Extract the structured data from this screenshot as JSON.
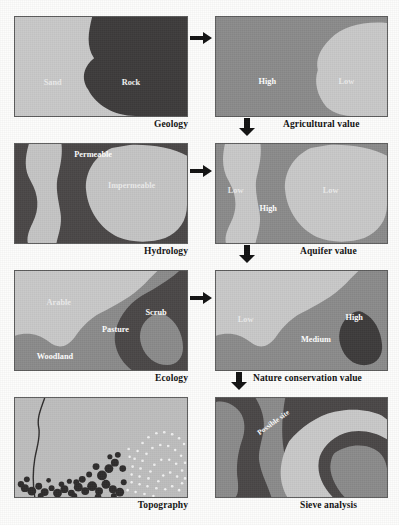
{
  "figure": {
    "colors": {
      "light_gray": "#c9c9c9",
      "mid_gray": "#8f8f8f",
      "dark_gray": "#4a4a4a",
      "very_dark": "#3b3b3b",
      "border": "#5d5d5d",
      "label_text": "#ffffff",
      "caption_text": "#111111",
      "page_background": "#fdfdfc"
    }
  },
  "panels": [
    {
      "id": "geology",
      "caption": "Geology",
      "caption_align": "right",
      "regions": [
        {
          "name": "sand",
          "label": "Sand",
          "tone": "light"
        },
        {
          "name": "rock",
          "label": "Rock",
          "tone": "very-dark"
        }
      ]
    },
    {
      "id": "agricultural-value",
      "caption": "Agricultural value",
      "caption_align": "left",
      "regions": [
        {
          "name": "high",
          "label": "High",
          "tone": "mid"
        },
        {
          "name": "low",
          "label": "Low",
          "tone": "light"
        }
      ]
    },
    {
      "id": "hydrology",
      "caption": "Hydrology",
      "caption_align": "right",
      "regions": [
        {
          "name": "permeable",
          "label": "Permeable",
          "tone": "dark"
        },
        {
          "name": "impermeable",
          "label": "Impermeable",
          "tone": "light"
        }
      ]
    },
    {
      "id": "aquifer-value",
      "caption": "Aquifer value",
      "caption_align": "left",
      "regions": [
        {
          "name": "low-west",
          "label": "Low",
          "tone": "light"
        },
        {
          "name": "high",
          "label": "High",
          "tone": "mid"
        },
        {
          "name": "low-east",
          "label": "Low",
          "tone": "light"
        }
      ]
    },
    {
      "id": "ecology",
      "caption": "Ecology",
      "caption_align": "right",
      "regions": [
        {
          "name": "arable",
          "label": "Arable",
          "tone": "light"
        },
        {
          "name": "pasture",
          "label": "Pasture",
          "tone": "mid"
        },
        {
          "name": "scrub",
          "label": "Scrub",
          "tone": "dark"
        },
        {
          "name": "woodland",
          "label": "Woodland",
          "tone": "mid"
        }
      ]
    },
    {
      "id": "nature-conservation-value",
      "caption": "Nature conservation value",
      "caption_align": "left",
      "regions": [
        {
          "name": "low",
          "label": "Low",
          "tone": "light"
        },
        {
          "name": "medium",
          "label": "Medium",
          "tone": "mid"
        },
        {
          "name": "high",
          "label": "High",
          "tone": "very-dark"
        }
      ]
    },
    {
      "id": "topography",
      "caption": "Topography",
      "caption_align": "right",
      "regions": [
        {
          "name": "slope-face",
          "label": "",
          "tone": "light"
        },
        {
          "name": "steep-ground-stipple",
          "label": "",
          "tone": "very-dark"
        },
        {
          "name": "contour-dots",
          "label": "",
          "tone": "light"
        }
      ]
    },
    {
      "id": "sieve-analysis",
      "caption": "Sieve analysis",
      "caption_align": "left",
      "regions": [
        {
          "name": "possible-site",
          "label": "Possible site",
          "tone": "light"
        },
        {
          "name": "constrained-a",
          "label": "",
          "tone": "dark"
        },
        {
          "name": "constrained-b",
          "label": "",
          "tone": "mid"
        }
      ]
    }
  ],
  "arrows": [
    {
      "name": "geology-to-agricultural",
      "direction": "right"
    },
    {
      "name": "agricultural-to-aquifer",
      "direction": "down"
    },
    {
      "name": "hydrology-to-aquifer",
      "direction": "right"
    },
    {
      "name": "aquifer-to-nature",
      "direction": "down"
    },
    {
      "name": "ecology-to-nature",
      "direction": "right"
    },
    {
      "name": "nature-to-sieve",
      "direction": "down"
    }
  ]
}
